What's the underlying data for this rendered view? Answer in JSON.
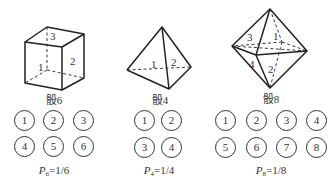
{
  "dice": [
    {
      "id": "cube",
      "caption": "骰6",
      "face_labels": [
        "3",
        "1",
        "2"
      ],
      "outcomes": [
        "1",
        "2",
        "3",
        "4",
        "5",
        "6"
      ],
      "prob_symbol": "P",
      "prob_sub": "6",
      "prob_value": "=1/6"
    },
    {
      "id": "tetrahedron",
      "caption": "骰4",
      "face_labels": [
        "1",
        "2"
      ],
      "outcomes": [
        "1",
        "2",
        "3",
        "4"
      ],
      "prob_symbol": "P",
      "prob_sub": "4",
      "prob_value": "=1/4"
    },
    {
      "id": "octahedron",
      "caption": "骰8",
      "face_labels": [
        "3",
        "1",
        "4",
        "2"
      ],
      "outcomes": [
        "1",
        "2",
        "3",
        "4",
        "5",
        "6",
        "7",
        "8"
      ],
      "prob_symbol": "P",
      "prob_sub": "8",
      "prob_value": "=1/8"
    }
  ]
}
